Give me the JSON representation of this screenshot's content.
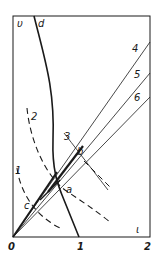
{
  "diagram": {
    "axes": {
      "y_label": "υ",
      "x_label": "ι",
      "x_ticks": [
        "0",
        "1",
        "2"
      ]
    },
    "curves": {
      "d": "d",
      "dashed_1": "1",
      "dashed_2": "2",
      "line_3": "3",
      "line_4": "4",
      "line_5": "5",
      "line_6": "6"
    },
    "points": {
      "a": "a",
      "b": "b",
      "c": "c"
    },
    "colors": {
      "ink": "#1a1a1a",
      "background": "#ffffff"
    }
  }
}
